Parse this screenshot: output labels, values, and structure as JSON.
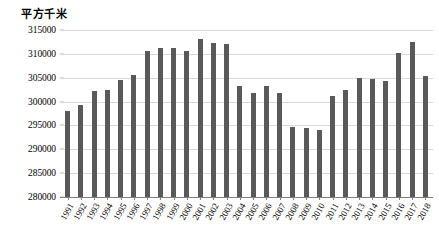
{
  "chart_data": {
    "type": "bar",
    "title": "",
    "axis_unit_label": "平方千米",
    "xlabel": "",
    "ylabel": "",
    "ylim": [
      280000,
      315000
    ],
    "ytick_step": 5000,
    "yticks": [
      "315000",
      "310000",
      "305000",
      "300000",
      "295000",
      "290000",
      "285000",
      "280000"
    ],
    "grid": true,
    "legend": false,
    "bar_color": "#595959",
    "gridline_color": "#D9D9D9",
    "axis_color": "#808080",
    "categories": [
      "1991",
      "1992",
      "1993",
      "1994",
      "1995",
      "1996",
      "1997",
      "1998",
      "1999",
      "2000",
      "2001",
      "2002",
      "2003",
      "2004",
      "2005",
      "2006",
      "2007",
      "2008",
      "2009",
      "2010",
      "2011",
      "2012",
      "2013",
      "2014",
      "2015",
      "2016",
      "2017",
      "2018"
    ],
    "values": [
      298000,
      299200,
      302200,
      302400,
      304500,
      305600,
      310500,
      311300,
      311200,
      310500,
      313200,
      312300,
      312100,
      303200,
      301800,
      303200,
      301900,
      294700,
      294400,
      294100,
      301100,
      302500,
      304900,
      304800,
      304300,
      310200,
      312400,
      305400
    ]
  }
}
